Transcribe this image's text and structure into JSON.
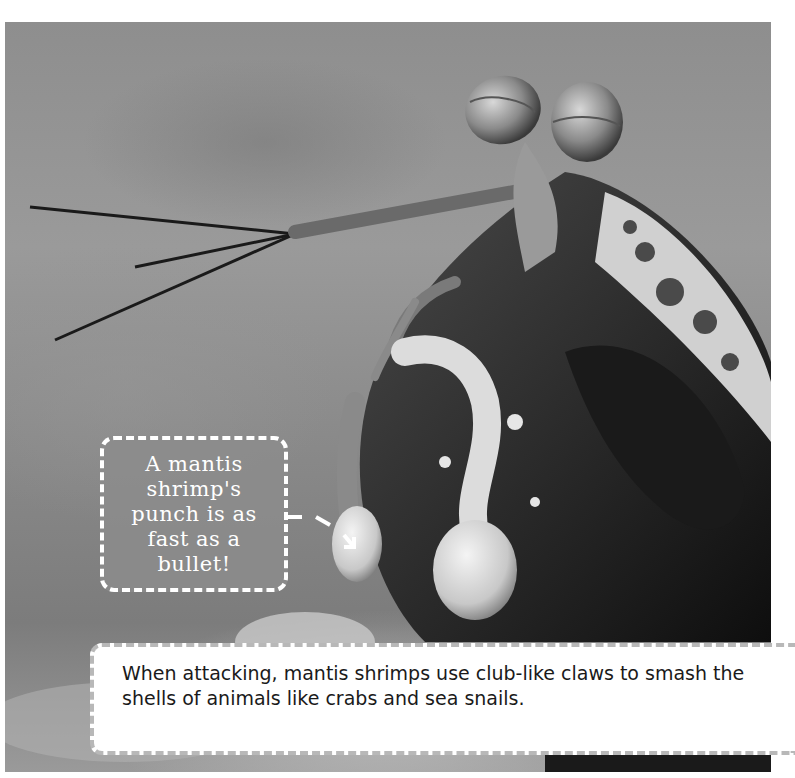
{
  "page": {
    "photo": {
      "subject": "mantis shrimp",
      "alt": "Close-up photo of a mantis shrimp with stalked eyes, antennae, and club-like claws"
    },
    "callout": {
      "text": "A mantis shrimp's punch is as fast as a bullet!",
      "border_color": "#ffffff",
      "fill_color": "#8c8c8c"
    },
    "caption": {
      "text": "When attacking, mantis shrimps use club-like claws to smash the shells of animals like crabs and sea snails.",
      "border_color": "#b8b8b8"
    }
  }
}
